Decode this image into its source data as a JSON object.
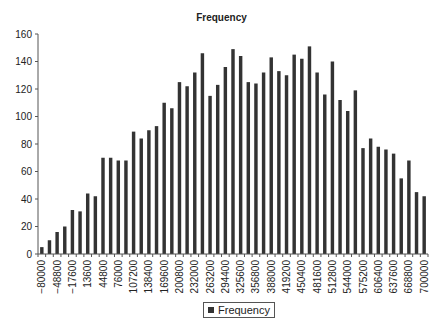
{
  "chart_data": {
    "type": "bar",
    "title": "Frequency",
    "xlabel": "",
    "ylabel": "",
    "ylim": [
      0,
      160
    ],
    "yticks": [
      0,
      20,
      40,
      60,
      80,
      100,
      120,
      140,
      160
    ],
    "grid": false,
    "legend_position": "bottom",
    "bar_color": "#333333",
    "categories": [
      "-80000",
      "-64400",
      "-48800",
      "-33200",
      "-17600",
      "-2000",
      "13600",
      "29200",
      "44800",
      "60400",
      "76000",
      "91600",
      "107200",
      "122800",
      "138400",
      "154000",
      "169600",
      "185200",
      "200800",
      "216400",
      "232000",
      "247600",
      "263200",
      "278800",
      "294400",
      "310000",
      "325600",
      "341200",
      "356800",
      "372400",
      "388000",
      "403600",
      "419200",
      "434800",
      "450400",
      "466000",
      "481600",
      "497200",
      "512800",
      "528400",
      "544000",
      "559600",
      "575200",
      "590800",
      "606400",
      "622000",
      "637600",
      "653200",
      "668800",
      "684400",
      "700000"
    ],
    "tick_labels_shown": [
      "-80000",
      "-48800",
      "-17600",
      "13600",
      "44800",
      "76000",
      "107200",
      "138400",
      "169600",
      "200800",
      "232000",
      "263200",
      "294400",
      "325600",
      "356800",
      "388000",
      "419200",
      "450400",
      "481600",
      "512800",
      "544000",
      "575200",
      "606400",
      "637600",
      "668800",
      "700000"
    ],
    "series": [
      {
        "name": "Frequency",
        "values": [
          5,
          10,
          16,
          20,
          32,
          31,
          44,
          42,
          70,
          70,
          68,
          68,
          89,
          84,
          90,
          93,
          110,
          106,
          125,
          122,
          132,
          146,
          115,
          123,
          136,
          149,
          144,
          125,
          124,
          132,
          143,
          133,
          130,
          145,
          142,
          151,
          132,
          116,
          140,
          112,
          104,
          119,
          77,
          84,
          78,
          76,
          73,
          55,
          68,
          45,
          42
        ]
      }
    ]
  },
  "legend": {
    "label": "Frequency"
  }
}
